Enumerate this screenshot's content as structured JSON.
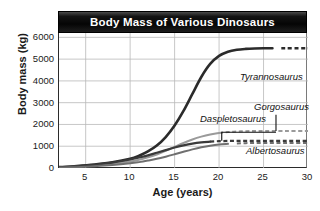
{
  "chart_data": {
    "type": "line",
    "title": "Body Mass of Various Dinosaurs",
    "xlabel": "Age (years)",
    "ylabel": "Body mass (kg)",
    "xlim": [
      2,
      30
    ],
    "ylim": [
      0,
      6200
    ],
    "xticks": [
      "5",
      "10",
      "15",
      "20",
      "25",
      "30"
    ],
    "xtick_values": [
      5,
      10,
      15,
      20,
      25,
      30
    ],
    "yticks": [
      "0",
      "1000",
      "2000",
      "3000",
      "4000",
      "5000",
      "6000"
    ],
    "ytick_values": [
      0,
      1000,
      2000,
      3000,
      4000,
      5000,
      6000
    ],
    "grid": "both",
    "legend": "inline-annotations",
    "x": [
      2,
      4,
      6,
      8,
      10,
      11,
      12,
      13,
      14,
      15,
      16,
      17,
      18,
      19,
      20,
      21,
      22,
      23,
      24,
      25,
      26,
      27,
      28
    ],
    "series": [
      {
        "name": "Tyrannosaurus",
        "color": "#2b2b2b",
        "width": 2.6,
        "plateau": 5500,
        "inflection_age": 16.5,
        "dashed_from_age": 26.5,
        "values": [
          40,
          90,
          160,
          260,
          420,
          560,
          760,
          1030,
          1420,
          1950,
          2620,
          3400,
          4180,
          4780,
          5150,
          5340,
          5430,
          5470,
          5490,
          5500,
          5500,
          5500,
          5500
        ]
      },
      {
        "name": "Gorgosaurus",
        "color": "#9a9a9a",
        "width": 2.0,
        "plateau": 1700,
        "inflection_age": 14.5,
        "dashed_from_age": 20.0,
        "values": [
          25,
          60,
          110,
          185,
          300,
          380,
          490,
          620,
          790,
          970,
          1150,
          1310,
          1440,
          1540,
          1610,
          1650,
          1675,
          1690,
          1697,
          1700,
          1700,
          1700,
          1700
        ]
      },
      {
        "name": "Daspletosaurus",
        "color": "#3a3a3a",
        "width": 2.2,
        "plateau": 1250,
        "inflection_age": 13.0,
        "dashed_from_age": 19.0,
        "values": [
          35,
          80,
          150,
          250,
          390,
          480,
          580,
          700,
          820,
          940,
          1040,
          1120,
          1175,
          1210,
          1232,
          1243,
          1248,
          1250,
          1250,
          1250,
          1250,
          1250,
          1250
        ]
      },
      {
        "name": "Albertosaurus",
        "color": "#6f6f6f",
        "width": 2.0,
        "plateau": 1150,
        "inflection_age": 15.5,
        "dashed_from_age": 21.5,
        "values": [
          15,
          40,
          80,
          135,
          215,
          270,
          340,
          420,
          520,
          630,
          745,
          855,
          950,
          1025,
          1080,
          1110,
          1130,
          1142,
          1147,
          1150,
          1150,
          1150,
          1150
        ]
      }
    ],
    "annotations": [
      {
        "text": "Tyrannosaurus",
        "x_px": 240,
        "y_px": 71
      },
      {
        "text": "Gorgosaurus",
        "x_px": 254,
        "y_px": 101
      },
      {
        "text": "Daspletosaurus",
        "x_px": 200,
        "y_px": 113
      },
      {
        "text": "Albertosaurus",
        "x_px": 246,
        "y_px": 145
      }
    ]
  }
}
